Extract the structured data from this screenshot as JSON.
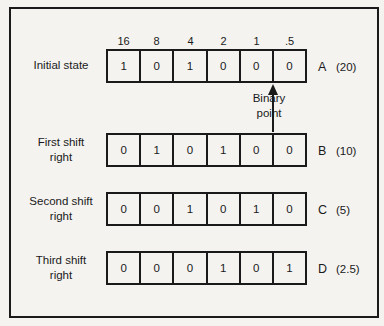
{
  "weights": [
    "16",
    "8",
    "4",
    "2",
    "1",
    ".5"
  ],
  "binary_point": {
    "label_line1": "Binary",
    "label_line2": "point"
  },
  "rows": [
    {
      "label_line1": "Initial state",
      "label_line2": "",
      "bits": [
        "1",
        "0",
        "1",
        "0",
        "0",
        "0"
      ],
      "register": "A",
      "value": "(20)"
    },
    {
      "label_line1": "First shift",
      "label_line2": "right",
      "bits": [
        "0",
        "1",
        "0",
        "1",
        "0",
        "0"
      ],
      "register": "B",
      "value": "(10)"
    },
    {
      "label_line1": "Second shift",
      "label_line2": "right",
      "bits": [
        "0",
        "0",
        "1",
        "0",
        "1",
        "0"
      ],
      "register": "C",
      "value": "(5)"
    },
    {
      "label_line1": "Third shift",
      "label_line2": "right",
      "bits": [
        "0",
        "0",
        "0",
        "1",
        "0",
        "1"
      ],
      "register": "D",
      "value": "(2.5)"
    }
  ]
}
